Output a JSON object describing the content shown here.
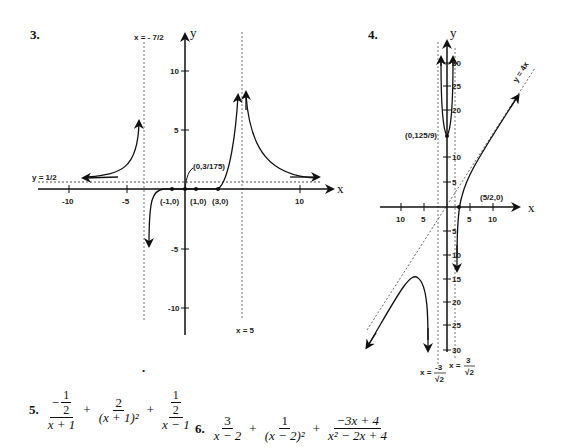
{
  "problems": [
    {
      "number": "3.",
      "graph": {
        "axis_x_label": "x",
        "axis_y_label": "y",
        "x_ticks": [
          "-10",
          "-5",
          "10"
        ],
        "y_ticks": [
          "10",
          "5",
          "-5",
          "-10"
        ],
        "asymptotes": {
          "vertical_left": "x = - 7/2",
          "vertical_right": "x = 5",
          "horizontal": "y = 1/2"
        },
        "points": [
          "(-1,0)",
          "(1,0)",
          "(3,0)",
          "(0,3/175)"
        ]
      }
    },
    {
      "number": "4.",
      "graph": {
        "axis_x_label": "x",
        "axis_y_label": "y",
        "x_ticks": [
          "10",
          "5",
          "5",
          "10"
        ],
        "y_ticks": [
          "30",
          "25",
          "20",
          "10",
          "5",
          "5",
          "10",
          "15",
          "20",
          "25",
          "30"
        ],
        "asymptotes": {
          "oblique": "y = 4x",
          "vertical_left": "x = -3/√2",
          "vertical_right": "x = 3/√2",
          "vertical_left_num": "-3",
          "vertical_left_den": "√2",
          "vertical_right_num": "3",
          "vertical_right_den": "√2",
          "x_eq": "x ="
        },
        "points": [
          "(0,125/9)",
          "(5/2,0)"
        ]
      }
    }
  ],
  "answers": {
    "p5": {
      "number": "5.",
      "terms": [
        {
          "num": "− 1/2",
          "num_top": "1",
          "num_bot": "2",
          "num_sign": "−",
          "den": "x + 1"
        },
        {
          "num": "2",
          "den": "(x + 1)²"
        },
        {
          "num": "1/2",
          "num_top": "1",
          "num_bot": "2",
          "den": "x − 1"
        }
      ],
      "op": "+"
    },
    "p6": {
      "number": "6.",
      "terms": [
        {
          "num": "3",
          "den": "x − 2"
        },
        {
          "num": "1",
          "den": "(x − 2)²"
        },
        {
          "num": "−3x + 4",
          "den": "x² − 2x + 4"
        }
      ],
      "op": "+"
    }
  },
  "stray_mark": "•"
}
